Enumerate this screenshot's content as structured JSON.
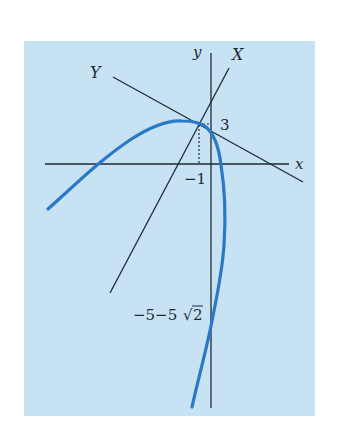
{
  "figure": {
    "type": "coordinate-diagram",
    "colors": {
      "background": "#c6e2f3",
      "axis": "#1f2a36",
      "curve": "#2a78c8"
    },
    "labels": {
      "x_axis": "x",
      "y_axis": "y",
      "X_axis": "X",
      "Y_axis": "Y",
      "point_y": "3",
      "point_x": "−1",
      "y_intercept": "−5−5√2",
      "y_intercept_prefix": "−5−5",
      "y_intercept_radicand": "2"
    },
    "key_point": {
      "x": -1,
      "y": 3
    },
    "y_axis_crossing": "-5-5*sqrt(2)"
  }
}
